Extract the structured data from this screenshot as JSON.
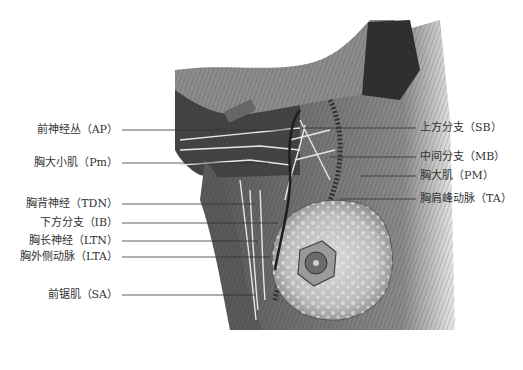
{
  "figure": {
    "colors": {
      "background": "#ffffff",
      "text": "#333333",
      "leader": "#333333"
    }
  },
  "labels_left": [
    {
      "text": "前神经丛（AP）",
      "y": 130,
      "right": 118,
      "line_to": 300
    },
    {
      "text": "胸大小肌（Pm）",
      "y": 163,
      "right": 118,
      "line_to": 268
    },
    {
      "text": "胸背神经（TDN）",
      "y": 204,
      "right": 118,
      "line_to": 255
    },
    {
      "text": "下方分支（IB）",
      "y": 223,
      "right": 118,
      "line_to": 278
    },
    {
      "text": "胸长神经（LTN）",
      "y": 241,
      "right": 118,
      "line_to": 258
    },
    {
      "text": "胸外侧动脉（LTA）",
      "y": 257,
      "right": 118,
      "line_to": 270
    },
    {
      "text": "前锯肌（SA）",
      "y": 295,
      "right": 118,
      "line_to": 255
    }
  ],
  "labels_right": [
    {
      "text": "上方分支（SB）",
      "y": 128,
      "left": 420,
      "line_from": 300
    },
    {
      "text": "中间分支（MB）",
      "y": 157,
      "left": 420,
      "line_from": 330
    },
    {
      "text": "胸大肌（PM）",
      "y": 176,
      "left": 420,
      "line_from": 360
    },
    {
      "text": "胸肩峰动脉（TA）",
      "y": 199,
      "left": 420,
      "line_from": 340
    }
  ]
}
